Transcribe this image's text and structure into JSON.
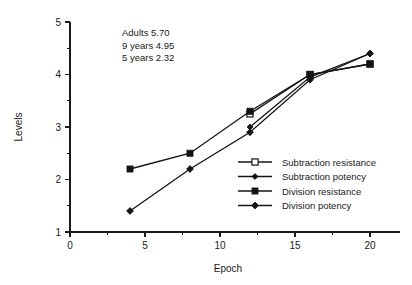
{
  "chart_data": {
    "type": "line",
    "title": "",
    "xlabel": "Epoch",
    "ylabel": "Levels",
    "xlim": [
      0,
      22
    ],
    "ylim": [
      1,
      5
    ],
    "grid": false,
    "legend_position": "inside-lower-right",
    "x_ticks_major": [
      0,
      5,
      10,
      15,
      20
    ],
    "x_ticks_minor": [
      2.5,
      7.5,
      12.5,
      17.5
    ],
    "y_ticks_major": [
      1,
      2,
      3,
      4,
      5
    ],
    "y_ticks_minor": [
      1.5,
      2.5,
      3.5,
      4.5
    ],
    "x_tick_labels": [
      "0",
      "5",
      "10",
      "15",
      "20"
    ],
    "y_tick_labels": [
      "1",
      "2",
      "3",
      "4",
      "5"
    ],
    "series": [
      {
        "name": "Subtraction resistance",
        "marker": "open-square",
        "x": [
          12,
          16,
          20
        ],
        "values": [
          3.25,
          4.0,
          4.2
        ]
      },
      {
        "name": "Subtraction potency",
        "marker": "filled-diamond-small",
        "x": [
          12,
          16,
          20
        ],
        "values": [
          3.0,
          3.95,
          4.4
        ]
      },
      {
        "name": "Division resistance",
        "marker": "filled-square",
        "x": [
          4,
          8,
          12,
          16,
          20
        ],
        "values": [
          2.2,
          2.5,
          3.3,
          4.0,
          4.2
        ]
      },
      {
        "name": "Division potency",
        "marker": "filled-diamond",
        "x": [
          4,
          8,
          12,
          16,
          20
        ],
        "values": [
          1.4,
          2.2,
          2.9,
          3.9,
          4.4
        ]
      }
    ],
    "annotations": [
      "Adults 5.70",
      "9 years 4.95",
      "5 years 2.32"
    ]
  },
  "legend": {
    "entries": [
      {
        "label": "Subtraction resistance",
        "marker": "open-square"
      },
      {
        "label": "Subtraction potency",
        "marker": "filled-diamond-small"
      },
      {
        "label": "Division resistance",
        "marker": "filled-square"
      },
      {
        "label": "Division potency",
        "marker": "filled-diamond"
      }
    ]
  },
  "axes": {
    "x_title": "Epoch",
    "y_title": "Levels"
  },
  "colors": {
    "ink": "#141414",
    "background": "#ffffff"
  }
}
